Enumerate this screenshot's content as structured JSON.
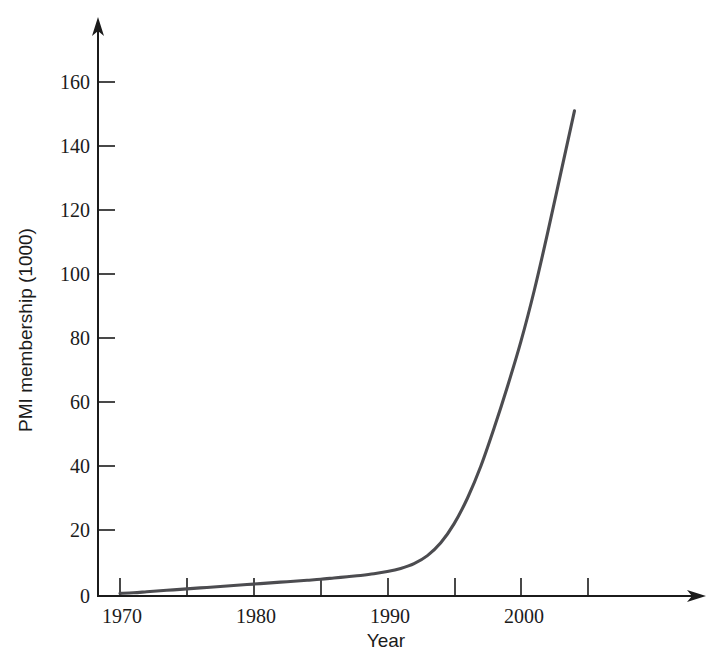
{
  "chart_data": {
    "type": "line",
    "title": "",
    "xlabel": "Year",
    "ylabel": "PMI membership (1000)",
    "xlim": [
      1968.5,
      2011
    ],
    "ylim": [
      0,
      175
    ],
    "grid": false,
    "legend": "none",
    "series": [
      {
        "name": "PMI membership",
        "color": "#4c4c50",
        "x": [
          1970,
          1971,
          1972,
          1973,
          1974,
          1975,
          1976,
          1977,
          1978,
          1979,
          1980,
          1981,
          1982,
          1983,
          1984,
          1985,
          1986,
          1987,
          1988,
          1989,
          1990,
          1991,
          1992,
          1993,
          1994,
          1995,
          1996,
          1997,
          1998,
          1999,
          2000,
          2001,
          2002,
          2003,
          2004
        ],
        "values": [
          0.2,
          0.4,
          0.7,
          1.0,
          1.3,
          1.6,
          1.9,
          2.2,
          2.5,
          2.8,
          3.1,
          3.4,
          3.7,
          4.0,
          4.3,
          4.6,
          5.0,
          5.4,
          5.8,
          6.3,
          7.0,
          8.0,
          9.5,
          12.0,
          16.0,
          22.0,
          30.0,
          40.0,
          52.0,
          65.0,
          79.0,
          95.0,
          113.0,
          132.0,
          151.0
        ]
      }
    ],
    "x_ticks": [
      1970,
      1975,
      1980,
      1985,
      1990,
      1995,
      2000,
      2005
    ],
    "x_tick_labels": [
      "1970",
      "",
      "1980",
      "",
      "1990",
      "",
      "2000",
      ""
    ],
    "y_ticks": [
      0,
      20,
      40,
      60,
      80,
      100,
      120,
      140,
      160
    ],
    "y_tick_labels": [
      "0",
      "20",
      "40",
      "60",
      "80",
      "100",
      "120",
      "140",
      "160"
    ]
  },
  "axis": {
    "x_arrow": "arrow-right",
    "y_arrow": "arrow-up"
  },
  "labels": {
    "y_0": "0",
    "y_20": "20",
    "y_40": "40",
    "y_60": "60",
    "y_80": "80",
    "y_100": "100",
    "y_120": "120",
    "y_140": "140",
    "y_160": "160",
    "x_1970": "1970",
    "x_1980": "1980",
    "x_1990": "1990",
    "x_2000": "2000",
    "x_title": "Year",
    "y_title": "PMI membership (1000)"
  }
}
